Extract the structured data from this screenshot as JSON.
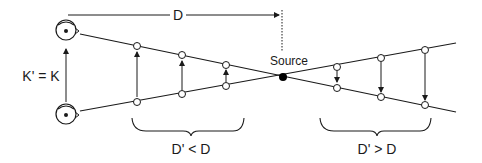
{
  "diagram": {
    "distance_label": "D",
    "source_label": "Source",
    "equality_label": "K' = K",
    "near_label": "D' < D",
    "far_label": "D' > D",
    "colors": {
      "stroke": "#1a1a1a",
      "background": "#ffffff",
      "point_fill": "#ffffff",
      "source_fill": "#000000"
    },
    "observers": [
      {
        "name": "top-eye",
        "icon": "eye-icon"
      },
      {
        "name": "bottom-eye",
        "icon": "eye-icon"
      }
    ]
  }
}
